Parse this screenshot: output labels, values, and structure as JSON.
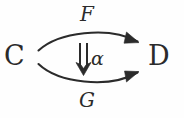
{
  "diagram": {
    "type": "natural-transformation-2-cell",
    "background_color": "#fefefe",
    "ink_color": "#2b2b2b",
    "objects": {
      "source": {
        "name": "source-category",
        "label": "C",
        "glyph": "script-C",
        "x": 18,
        "y": 58
      },
      "target": {
        "name": "target-category",
        "label": "D",
        "glyph": "script-D",
        "x": 162,
        "y": 58
      }
    },
    "arrows": {
      "top": {
        "name": "functor-F",
        "label": "F",
        "icon": "curved-arrow-right-icon",
        "direction": "source-to-target",
        "curvature": "up"
      },
      "bottom": {
        "name": "functor-G",
        "label": "G",
        "icon": "curved-arrow-right-icon",
        "direction": "source-to-target",
        "curvature": "down"
      },
      "middle": {
        "name": "natural-transformation-alpha",
        "label": "α",
        "icon": "double-arrow-down-icon",
        "direction": "top-to-bottom"
      }
    }
  }
}
